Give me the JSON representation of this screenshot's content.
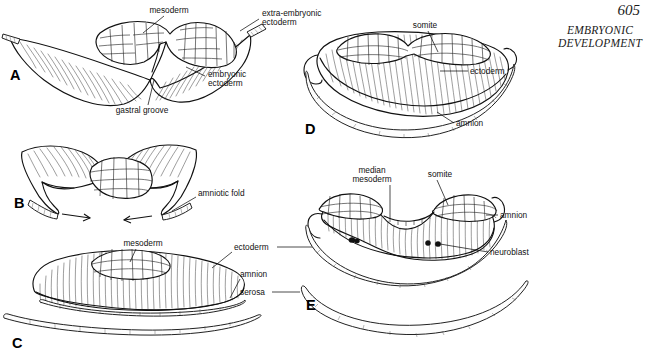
{
  "header": {
    "page_number": "605",
    "running_title": "EMBRYONIC DEVELOPMENT"
  },
  "figure": {
    "panels": [
      {
        "id": "A",
        "letter": "A"
      },
      {
        "id": "B",
        "letter": "B"
      },
      {
        "id": "C",
        "letter": "C"
      },
      {
        "id": "D",
        "letter": "D"
      },
      {
        "id": "E",
        "letter": "E"
      }
    ],
    "labels": {
      "a_mesoderm": "mesoderm",
      "a_extra_embryonic": "extra-embryonic",
      "a_ectoderm2": "ectoderm",
      "a_embryonic": "embryonic",
      "a_ectoderm": "ectoderm",
      "a_gastral_groove": "gastral groove",
      "b_amniotic_fold": "amniotic fold",
      "c_mesoderm": "mesoderm",
      "c_ectoderm": "ectoderm",
      "c_amnion": "amnion",
      "c_serosa": "serosa",
      "d_somite": "somite",
      "d_ectoderm": "ectoderm",
      "d_amnion": "amnion",
      "e_median": "median",
      "e_mesoderm": "mesoderm",
      "e_somite": "somite",
      "e_amnion": "amnion",
      "e_neuroblast": "neuroblast"
    }
  },
  "colors": {
    "ink": "#111111",
    "background": "#ffffff"
  }
}
